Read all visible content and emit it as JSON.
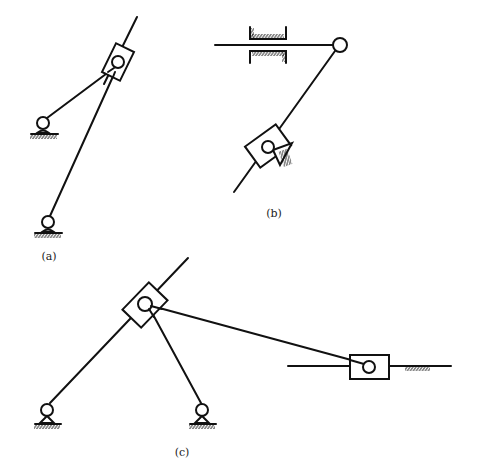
{
  "figure": {
    "stroke_color": "#111111",
    "background": "#ffffff"
  },
  "panels": [
    {
      "id": "a",
      "label": "(a)",
      "label_pos": [
        49,
        256
      ],
      "components": {
        "guide_rod": {
          "from": [
            137,
            17
          ],
          "to": [
            104,
            84
          ]
        },
        "slider_block": {
          "center": [
            118,
            62
          ],
          "width": 20,
          "height": 32,
          "angle_deg": 26
        },
        "slider_pin": {
          "center": [
            118,
            62
          ],
          "r": 6
        },
        "link_1": {
          "from": [
            114,
            68
          ],
          "to": [
            47,
            118
          ]
        },
        "link_2": {
          "from": [
            115,
            72
          ],
          "to": [
            50,
            216
          ]
        },
        "ground_pivots": [
          {
            "center": [
              43,
              123
            ],
            "r": 6
          },
          {
            "center": [
              48,
              222
            ],
            "r": 6
          }
        ]
      }
    },
    {
      "id": "b",
      "label": "(b)",
      "label_pos": [
        274,
        213
      ],
      "components": {
        "horizontal_rod": {
          "from": [
            215,
            45
          ],
          "to": [
            333,
            45
          ]
        },
        "guide_bearing": {
          "x1": 250,
          "x2": 286,
          "y_top": 27,
          "y_bottom": 63
        },
        "end_pivot": {
          "center": [
            340,
            45
          ],
          "r": 7
        },
        "diagonal_rod": {
          "from": [
            335,
            51
          ],
          "to": [
            234,
            192
          ]
        },
        "slider_block": {
          "center": [
            268,
            146
          ],
          "width": 26,
          "height": 38,
          "angle_deg": 54
        },
        "slider_pin": {
          "center": [
            268,
            147
          ],
          "r": 6
        },
        "ground_triangle": {
          "points": [
            [
              272,
              149
            ],
            [
              293,
              144
            ],
            [
              280,
              165
            ]
          ]
        }
      }
    },
    {
      "id": "c",
      "label": "(c)",
      "label_pos": [
        182,
        452
      ],
      "components": {
        "guide_rod": {
          "from": [
            188,
            258
          ],
          "to": [
            50,
            403
          ]
        },
        "slider_block": {
          "center": [
            145,
            305
          ],
          "width": 26,
          "height": 38,
          "angle_deg": 44
        },
        "slider_pin": {
          "center": [
            145,
            304
          ],
          "r": 7
        },
        "link_short": {
          "from": [
            150,
            309
          ],
          "to": [
            201,
            403
          ]
        },
        "link_long": {
          "from": [
            152,
            306
          ],
          "to": [
            366,
            364
          ]
        },
        "horizontal_rail": {
          "from": [
            288,
            366
          ],
          "to": [
            451,
            366
          ]
        },
        "rail_slider": {
          "x": 350,
          "y": 355,
          "width": 39,
          "height": 24
        },
        "rail_slider_pin": {
          "center": [
            369,
            367
          ],
          "r": 6
        },
        "rail_hatch": {
          "x_from": 405,
          "x_to": 430,
          "y": 366
        },
        "ground_pivots": [
          {
            "center": [
              47,
              410
            ],
            "r": 6
          },
          {
            "center": [
              202,
              410
            ],
            "r": 6
          }
        ]
      }
    }
  ]
}
